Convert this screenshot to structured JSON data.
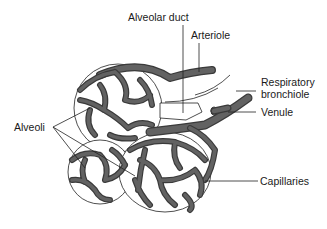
{
  "diagram": {
    "type": "anatomical-illustration",
    "colors": {
      "background": "#ffffff",
      "vessel_fill": "#626262",
      "vessel_outline": "#3a3a3a",
      "line": "#222222",
      "text": "#1a1a1a"
    },
    "labels": {
      "alveolar_duct": "Alveolar duct",
      "arteriole": "Arteriole",
      "respiratory_bronchiole_line1": "Respiratory",
      "respiratory_bronchiole_line2": "bronchiole",
      "venule": "Venule",
      "alveoli": "Alveoli",
      "capillaries": "Capillaries"
    }
  }
}
